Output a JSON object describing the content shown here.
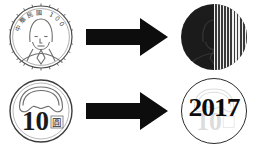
{
  "figure": {
    "background_color": "#ffffff",
    "rows": [
      {
        "id": "row-top",
        "source": {
          "kind": "coin-obverse",
          "legend_text": "中華民國 100 年",
          "legend_characters": [
            "中",
            "華",
            "民",
            "國"
          ],
          "denomination_year": "100",
          "trailing_character": "年",
          "description": "portrait coin obverse"
        },
        "arrow": {
          "direction": "right",
          "color": "#0d0d0d",
          "label": "transforms to"
        },
        "result": {
          "kind": "split-disc",
          "left_fill": "#1c1c1c",
          "right_fill": "#565656",
          "right_pattern": "vertical-dither",
          "ghost_content": "portrait",
          "ring": false
        }
      },
      {
        "id": "row-bottom",
        "source": {
          "kind": "coin-reverse",
          "denomination": "10",
          "unit_character": "圓",
          "motif": "plum-blossom-arc",
          "description": "ten dollar coin reverse"
        },
        "arrow": {
          "direction": "right",
          "color": "#0d0d0d",
          "label": "transforms to"
        },
        "result": {
          "kind": "year-overlay-disc",
          "year_text": "2017",
          "ghost_content": "10",
          "ring": true,
          "ring_color": "#2b2b2b",
          "text_color": "#0d0d0d"
        }
      }
    ]
  },
  "colors": {
    "ink": "#0d0d0d",
    "coin_outline": "#4a4a4a",
    "dark_half": "#1c1c1c",
    "gray_half": "#565656",
    "paper": "#ffffff"
  }
}
